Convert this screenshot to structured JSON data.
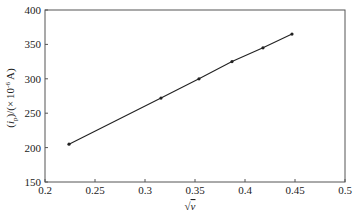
{
  "chart_data": {
    "type": "line",
    "title": "",
    "xlabel": "√v",
    "ylabel": "(i_p)/(×10⁻⁶ A)",
    "xlim": [
      0.2,
      0.5
    ],
    "ylim": [
      150,
      400
    ],
    "x_ticks": [
      "0.2",
      "0.25",
      "0.3",
      "0.35",
      "0.4",
      "0.45",
      "0.5"
    ],
    "y_ticks": [
      "150",
      "200",
      "250",
      "300",
      "350",
      "400"
    ],
    "grid": false,
    "legend": null,
    "series": [
      {
        "name": "i_p vs √v",
        "x": [
          0.224,
          0.316,
          0.354,
          0.387,
          0.418,
          0.447
        ],
        "y": [
          205,
          272,
          300,
          325,
          345,
          365
        ],
        "marker": "dot",
        "color": "#222222"
      }
    ]
  },
  "axes": {
    "xlabel_main": "√",
    "xlabel_var": "v",
    "ylabel_parts": {
      "open": "(",
      "i": "i",
      "sub": "p",
      "mid": ")/(",
      "times": "×",
      "ten": "10",
      "exp": "-6",
      "unit": " A)"
    }
  },
  "colors": {
    "line": "#222222",
    "frame": "#444444",
    "background": "#ffffff"
  }
}
